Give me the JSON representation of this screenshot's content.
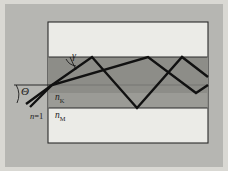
{
  "figure": {
    "labels": {
      "theta": "Θ",
      "gamma": "γ",
      "n_outside_prefix": "n",
      "n_outside_value": "=1",
      "n_core_base": "n",
      "n_core_sub": "K",
      "n_sub_base": "n",
      "n_sub_sub": "M"
    },
    "colors": {
      "page_border": "#d9d8d3",
      "backdrop": "#b6b6b2",
      "panel_fill": "#ebebe7",
      "panel_stroke": "#2a2a2a",
      "cladding_fill": "#9b9b96",
      "core_fill": "#8d8d88",
      "ray_stroke": "#111111",
      "axis_stroke": "#6f6f6c",
      "angle_arc_stroke": "#1b1b1b"
    },
    "geometry": {
      "panel": {
        "x": 48,
        "y": 22,
        "w": 160,
        "h": 121
      },
      "cladding_band": {
        "y": 57,
        "h": 51
      },
      "core_band": {
        "y": 57,
        "h": 36
      },
      "axis_y": 85,
      "entry_point": {
        "x": 52,
        "y": 85
      }
    },
    "rays": {
      "steep_path": "M 26,104 L 52,85 L 92,57 L 137,108 L 182,57 L 208,77",
      "shallow_path": "M 30,107 L 52,85 L 148,57 L 196,93 L 208,85",
      "ray_width": 2.4
    }
  }
}
